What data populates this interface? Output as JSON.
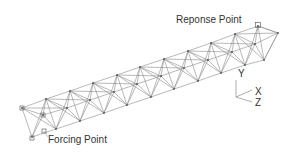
{
  "labels": {
    "response_point": "Reponse Point",
    "forcing_point": "Forcing Point"
  },
  "axes": {
    "y": "Y",
    "x": "X",
    "z": "Z"
  },
  "colors": {
    "line": "#8a8a8a",
    "text": "#333333",
    "background": "#ffffff"
  },
  "truss": {
    "bays": 10,
    "top_front": [
      [
        22,
        108
      ],
      [
        46,
        99
      ],
      [
        70,
        91
      ],
      [
        93,
        83
      ],
      [
        117,
        75
      ],
      [
        140,
        67
      ],
      [
        164,
        59
      ],
      [
        188,
        51
      ],
      [
        211,
        43
      ],
      [
        235,
        34
      ],
      [
        258,
        26
      ]
    ],
    "top_back": [
      [
        22,
        108
      ],
      [
        46,
        99
      ],
      [
        70,
        91
      ],
      [
        93,
        83
      ],
      [
        117,
        75
      ],
      [
        140,
        67
      ],
      [
        164,
        59
      ],
      [
        188,
        51
      ],
      [
        211,
        43
      ],
      [
        235,
        34
      ],
      [
        258,
        26
      ]
    ],
    "mid": [
      [
        43,
        115
      ],
      [
        67,
        108
      ],
      [
        90,
        100
      ],
      [
        114,
        92
      ],
      [
        137,
        84
      ],
      [
        161,
        76
      ],
      [
        184,
        68
      ],
      [
        208,
        60
      ],
      [
        232,
        52
      ],
      [
        255,
        44
      ],
      [
        278,
        33
      ]
    ],
    "bottom": [
      [
        32,
        137
      ],
      [
        56,
        129
      ],
      [
        80,
        121
      ],
      [
        104,
        113
      ],
      [
        127,
        105
      ],
      [
        151,
        97
      ],
      [
        174,
        89
      ],
      [
        198,
        81
      ],
      [
        221,
        73
      ],
      [
        245,
        65
      ],
      [
        264,
        60
      ]
    ],
    "response_marker": [
      258,
      25
    ],
    "forcing_markers": [
      [
        32,
        138
      ],
      [
        44,
        131
      ],
      [
        22,
        108
      ],
      [
        43,
        115
      ]
    ]
  }
}
